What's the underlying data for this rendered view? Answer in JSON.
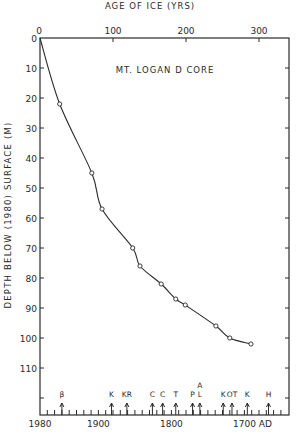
{
  "chart_data": {
    "type": "line",
    "title": "MT. LOGAN D CORE",
    "top_axis": {
      "label": "AGE OF ICE (YRS)",
      "ticks": [
        0,
        100,
        200,
        300
      ],
      "range": [
        0,
        342
      ]
    },
    "bottom_axis": {
      "ticks": [
        "1980",
        "1900",
        "1800",
        "1700 AD"
      ],
      "tick_values": [
        1980,
        1900,
        1800,
        1700
      ],
      "range": [
        1980,
        1638
      ]
    },
    "ylabel": "DEPTH BELOW (1980) SURFACE (M)",
    "yticks": [
      0,
      10,
      20,
      30,
      40,
      50,
      60,
      70,
      80,
      90,
      100,
      110
    ],
    "ylim": [
      0,
      125
    ],
    "y_inverted": true,
    "series": [
      {
        "name": "Depth vs age",
        "marker": "open-circle",
        "points": [
          {
            "age": 0,
            "depth": 0
          },
          {
            "age": 27,
            "depth": 22
          },
          {
            "age": 71,
            "depth": 45
          },
          {
            "age": 85,
            "depth": 57
          },
          {
            "age": 127,
            "depth": 70
          },
          {
            "age": 137,
            "depth": 76
          },
          {
            "age": 166,
            "depth": 82
          },
          {
            "age": 186,
            "depth": 87
          },
          {
            "age": 199,
            "depth": 89
          },
          {
            "age": 241,
            "depth": 96
          },
          {
            "age": 260,
            "depth": 100
          },
          {
            "age": 289,
            "depth": 102
          }
        ]
      }
    ],
    "event_markers": [
      {
        "label": "β",
        "age": 30
      },
      {
        "label": "K",
        "age": 98
      },
      {
        "label": "KR",
        "age": 119
      },
      {
        "label": "C",
        "age": 154
      },
      {
        "label": "C",
        "age": 168
      },
      {
        "label": "T",
        "age": 186
      },
      {
        "label": "P",
        "age": 209
      },
      {
        "label": "A L",
        "age": 219
      },
      {
        "label": "K",
        "age": 251
      },
      {
        "label": "OT",
        "age": 263
      },
      {
        "label": "K",
        "age": 284
      },
      {
        "label": "H",
        "age": 313
      }
    ],
    "grid": false,
    "legend": null
  }
}
